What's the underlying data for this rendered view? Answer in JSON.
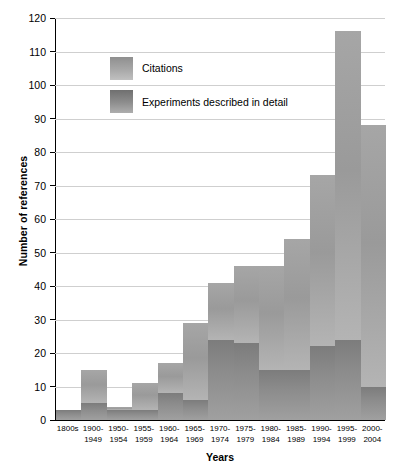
{
  "chart_data": {
    "type": "bar",
    "stacked": true,
    "title": "",
    "xlabel": "Years",
    "ylabel": "Number of references",
    "ylim": [
      0,
      120
    ],
    "ytick_step": 10,
    "yticks": [
      0,
      10,
      20,
      30,
      40,
      50,
      60,
      70,
      80,
      90,
      100,
      110,
      120
    ],
    "grid": "horizontal",
    "legend_position": "upper-left-inside",
    "categories": [
      "1800s",
      "1900-1949",
      "1950-1954",
      "1955-1959",
      "1960-1964",
      "1965-1969",
      "1970-1974",
      "1975-1979",
      "1980-1984",
      "1985-1989",
      "1990-1994",
      "1995-1999",
      "2000-2004"
    ],
    "categories_lines": [
      [
        "1800s",
        ""
      ],
      [
        "1900-",
        "1949"
      ],
      [
        "1950-",
        "1954"
      ],
      [
        "1955-",
        "1959"
      ],
      [
        "1960-",
        "1964"
      ],
      [
        "1965-",
        "1969"
      ],
      [
        "1970-",
        "1974"
      ],
      [
        "1975-",
        "1979"
      ],
      [
        "1980-",
        "1984"
      ],
      [
        "1985-",
        "1989"
      ],
      [
        "1990-",
        "1994"
      ],
      [
        "1995-",
        "1999"
      ],
      [
        "2000-",
        "2004"
      ]
    ],
    "series": [
      {
        "name": "Citations",
        "note": "total bar height (includes experiments portion)",
        "color": "#a3a3a3",
        "values": [
          3,
          15,
          4,
          11,
          17,
          29,
          41,
          46,
          46,
          54,
          73,
          116,
          88
        ]
      },
      {
        "name": "Experiments described in detail",
        "note": "lower dark segment of each bar",
        "color": "#8a8a8a",
        "values": [
          3,
          5,
          3,
          3,
          8,
          6,
          24,
          23,
          15,
          15,
          22,
          24,
          10
        ]
      }
    ]
  },
  "legend": {
    "items": [
      {
        "label": "Citations",
        "swatch": "citations"
      },
      {
        "label": "Experiments described in detail",
        "swatch": "experiments"
      }
    ]
  },
  "axes": {
    "y_title": "Number of references",
    "x_title": "Years"
  }
}
